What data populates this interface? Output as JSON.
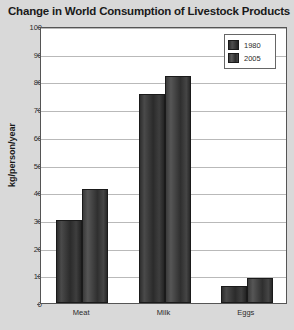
{
  "chart_data": {
    "type": "bar",
    "title": "Change in World Consumption of Livestock Products",
    "xlabel": "",
    "ylabel": "kg/person/year",
    "categories": [
      "Meat",
      "Milk",
      "Eggs"
    ],
    "series": [
      {
        "name": "1980",
        "values": [
          30,
          75.5,
          6
        ]
      },
      {
        "name": "2005",
        "values": [
          41,
          82,
          9
        ]
      }
    ],
    "ylim": [
      0,
      100
    ],
    "yticks": [
      0,
      10,
      20,
      30,
      40,
      50,
      60,
      70,
      80,
      90,
      100
    ],
    "grid": true,
    "legend_position": "top-right",
    "colors": {
      "background": "#d9d9d9",
      "plot_area": "#ffffff",
      "bar_1980": "#2e2e2e",
      "bar_2005": "#3a3a3a",
      "gridline": "#b9b9b9",
      "axis": "#555555",
      "text": "#1a1a1a"
    }
  }
}
